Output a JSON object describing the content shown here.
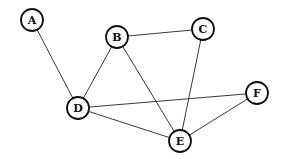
{
  "diagram": {
    "type": "undirected-graph",
    "node_radius": 11,
    "colors": {
      "stroke": "#111111",
      "edge": "#3a3a3a",
      "fill": "#ffffff",
      "background": "#ffffff"
    },
    "nodes": [
      {
        "id": "A",
        "label": "A",
        "x": 32,
        "y": 20
      },
      {
        "id": "B",
        "label": "B",
        "x": 117,
        "y": 37
      },
      {
        "id": "C",
        "label": "C",
        "x": 203,
        "y": 29
      },
      {
        "id": "D",
        "label": "D",
        "x": 78,
        "y": 108
      },
      {
        "id": "E",
        "label": "E",
        "x": 180,
        "y": 141
      },
      {
        "id": "F",
        "label": "F",
        "x": 257,
        "y": 93
      }
    ],
    "edges": [
      {
        "from": "A",
        "to": "D"
      },
      {
        "from": "B",
        "to": "C"
      },
      {
        "from": "B",
        "to": "D"
      },
      {
        "from": "B",
        "to": "E"
      },
      {
        "from": "C",
        "to": "E"
      },
      {
        "from": "D",
        "to": "F"
      },
      {
        "from": "D",
        "to": "E"
      },
      {
        "from": "E",
        "to": "F"
      }
    ]
  }
}
